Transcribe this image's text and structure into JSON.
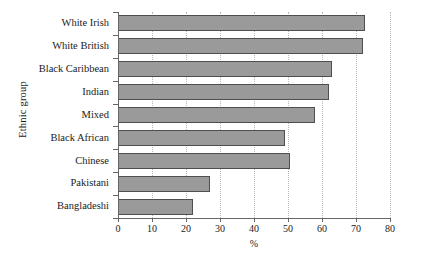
{
  "chart_data": {
    "type": "bar",
    "orientation": "horizontal",
    "title": "",
    "xlabel": "%",
    "ylabel": "Ethnic group",
    "categories": [
      "White Irish",
      "White British",
      "Black Caribbean",
      "Indian",
      "Mixed",
      "Black African",
      "Chinese",
      "Pakistani",
      "Bangladeshi"
    ],
    "values": [
      72.5,
      72,
      63,
      62,
      58,
      49,
      50.5,
      27,
      22
    ],
    "xlim": [
      0,
      80
    ],
    "ylim": [
      0,
      9
    ],
    "xticks": [
      0,
      10,
      20,
      30,
      40,
      50,
      60,
      70,
      80
    ],
    "xtick_labels": [
      "0",
      "10",
      "20",
      "30",
      "40",
      "50",
      "60",
      "70",
      "80"
    ],
    "grid": "vertical-dotted",
    "legend": "none",
    "bar_fill_color": "#9a9a9a",
    "bar_edge_color": "#4f4f4f",
    "axis_color": "#666666",
    "grid_color": "#b9b9b9",
    "background_color": "#ffffff"
  }
}
